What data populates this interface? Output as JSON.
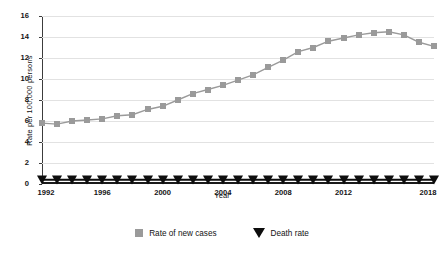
{
  "chart_data": {
    "type": "line",
    "title": "",
    "xlabel": "Year",
    "ylabel": "Rate  per  100,000  persons",
    "xlim": [
      1992,
      2018
    ],
    "ylim": [
      0,
      16
    ],
    "ytick_values": [
      0,
      2,
      4,
      6,
      8,
      10,
      12,
      14,
      16
    ],
    "ytick_labels": [
      "0",
      "2",
      "4",
      "6",
      "8",
      "10",
      "12",
      "14",
      "16"
    ],
    "xtick_values": [
      1992,
      1996,
      2000,
      2004,
      2008,
      2012,
      2018
    ],
    "xtick_labels": [
      "1992",
      "1996",
      "2000",
      "2004",
      "2008",
      "2012",
      "2018"
    ],
    "grid": true,
    "legend_position": "bottom",
    "x": [
      1992,
      1993,
      1994,
      1995,
      1996,
      1997,
      1998,
      1999,
      2000,
      2001,
      2002,
      2003,
      2004,
      2005,
      2006,
      2007,
      2008,
      2009,
      2010,
      2011,
      2012,
      2013,
      2014,
      2015,
      2016,
      2017,
      2018
    ],
    "series": [
      {
        "name": "Rate of new cases",
        "marker": "square",
        "color": "#9a9a9a",
        "values": [
          5.8,
          5.7,
          6.0,
          6.1,
          6.2,
          6.5,
          6.6,
          7.1,
          7.4,
          8.0,
          8.6,
          9.0,
          9.4,
          9.9,
          10.4,
          11.1,
          11.8,
          12.6,
          13.0,
          13.6,
          13.9,
          14.2,
          14.4,
          14.5,
          14.2,
          13.5,
          13.1
        ]
      },
      {
        "name": "Death rate",
        "marker": "triangle",
        "color": "#0d0d0d",
        "values": [
          0.4,
          0.4,
          0.4,
          0.4,
          0.4,
          0.4,
          0.4,
          0.4,
          0.4,
          0.4,
          0.4,
          0.4,
          0.4,
          0.4,
          0.4,
          0.4,
          0.4,
          0.4,
          0.4,
          0.4,
          0.4,
          0.4,
          0.4,
          0.4,
          0.4,
          0.4,
          0.4
        ]
      }
    ]
  },
  "legend": {
    "items": [
      {
        "label": "Rate of new cases",
        "marker": "square"
      },
      {
        "label": "Death rate",
        "marker": "triangle"
      }
    ]
  }
}
